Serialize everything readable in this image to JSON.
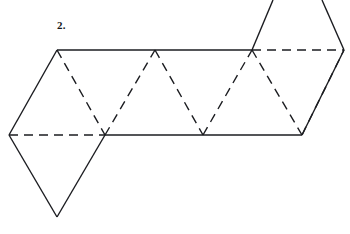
{
  "figure": {
    "label": "2.",
    "caption_position": {
      "x": 57,
      "y": 19
    },
    "canvas": {
      "width": 350,
      "height": 234,
      "background": "#ffffff"
    },
    "stroke": {
      "color": "#1b1c20",
      "width": 1.4,
      "dash_pattern": "9 6",
      "linecap": "butt"
    },
    "vertices": {
      "top_left_apex": {
        "x": 57,
        "y": 50
      },
      "top_mid_apex": {
        "x": 155,
        "y": 50
      },
      "top_right_apex": {
        "x": 252,
        "y": 50
      },
      "top_far_right": {
        "x": 344,
        "y": 50
      },
      "bottom_far_left": {
        "x": 9,
        "y": 135
      },
      "bottom_first": {
        "x": 105,
        "y": 135
      },
      "bottom_second": {
        "x": 203,
        "y": 135
      },
      "bottom_third": {
        "x": 302,
        "y": 135
      },
      "lower_triangle_apex": {
        "x": 57,
        "y": 217
      },
      "upper_triangle_left_exit": {
        "x": 273,
        "y": 0
      },
      "upper_triangle_right_exit": {
        "x": 322,
        "y": 0
      }
    },
    "segments": [
      {
        "name": "top-edge-solid",
        "style": "solid",
        "from": [
          57,
          50
        ],
        "to": [
          252,
          50
        ]
      },
      {
        "name": "top-edge-dashed",
        "style": "dashed",
        "from": [
          252,
          50
        ],
        "to": [
          344,
          50
        ]
      },
      {
        "name": "bottom-edge-dashed",
        "style": "dashed",
        "from": [
          9,
          135
        ],
        "to": [
          105,
          135
        ]
      },
      {
        "name": "bottom-edge-solid",
        "style": "solid",
        "from": [
          105,
          135
        ],
        "to": [
          302,
          135
        ]
      },
      {
        "name": "left-outer-edge",
        "style": "solid",
        "from": [
          57,
          50
        ],
        "to": [
          9,
          135
        ]
      },
      {
        "name": "right-outer-edge",
        "style": "solid",
        "from": [
          344,
          50
        ],
        "to": [
          302,
          135
        ]
      },
      {
        "name": "fold-1",
        "style": "dashed",
        "from": [
          57,
          50
        ],
        "to": [
          105,
          135
        ]
      },
      {
        "name": "fold-2",
        "style": "dashed",
        "from": [
          105,
          135
        ],
        "to": [
          155,
          50
        ]
      },
      {
        "name": "fold-3",
        "style": "dashed",
        "from": [
          155,
          50
        ],
        "to": [
          203,
          135
        ]
      },
      {
        "name": "fold-4",
        "style": "dashed",
        "from": [
          203,
          135
        ],
        "to": [
          252,
          50
        ]
      },
      {
        "name": "fold-5",
        "style": "dashed",
        "from": [
          252,
          50
        ],
        "to": [
          302,
          135
        ]
      },
      {
        "name": "fold-6",
        "style": "dashed",
        "from": [
          302,
          135
        ],
        "to": [
          344,
          50
        ]
      },
      {
        "name": "lower-flap-left",
        "style": "solid",
        "from": [
          9,
          135
        ],
        "to": [
          57,
          217
        ]
      },
      {
        "name": "lower-flap-right",
        "style": "solid",
        "from": [
          57,
          217
        ],
        "to": [
          105,
          135
        ]
      },
      {
        "name": "upper-flap-left",
        "style": "solid",
        "from": [
          252,
          50
        ],
        "to": [
          273,
          0
        ]
      },
      {
        "name": "upper-flap-right",
        "style": "solid",
        "from": [
          344,
          50
        ],
        "to": [
          322,
          0
        ]
      }
    ]
  }
}
